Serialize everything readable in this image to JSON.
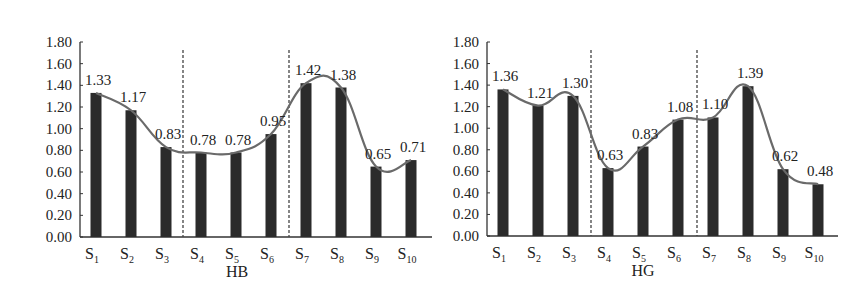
{
  "chart_data": [
    {
      "type": "bar",
      "title": "HB",
      "xlabel": "HB",
      "ylabel": "",
      "ylim": [
        0,
        1.8
      ],
      "yticks": [
        "0.00",
        "0.20",
        "0.40",
        "0.60",
        "0.80",
        "1.00",
        "1.20",
        "1.40",
        "1.60",
        "1.80"
      ],
      "grid": false,
      "legend": null,
      "categories": [
        "S1",
        "S2",
        "S3",
        "S4",
        "S5",
        "S6",
        "S7",
        "S8",
        "S9",
        "S10"
      ],
      "values": [
        1.33,
        1.17,
        0.83,
        0.78,
        0.78,
        0.95,
        1.42,
        1.38,
        0.65,
        0.71
      ],
      "value_labels": [
        "1.33",
        "1.17",
        "0.83",
        "0.78",
        "0.78",
        "0.95",
        "1.42",
        "1.38",
        "0.65",
        "0.71"
      ],
      "overlay": "smoothed trend line through bar tops",
      "dashed_separators_after": [
        "S3",
        "S6"
      ]
    },
    {
      "type": "bar",
      "title": "HG",
      "xlabel": "HG",
      "ylabel": "",
      "ylim": [
        0,
        1.8
      ],
      "yticks": [
        "0.00",
        "0.20",
        "0.40",
        "0.60",
        "0.80",
        "1.00",
        "1.20",
        "1.40",
        "1.60",
        "1.80"
      ],
      "grid": false,
      "legend": null,
      "categories": [
        "S1",
        "S2",
        "S3",
        "S4",
        "S5",
        "S6",
        "S7",
        "S8",
        "S9",
        "S10"
      ],
      "values": [
        1.36,
        1.21,
        1.3,
        0.63,
        0.83,
        1.08,
        1.1,
        1.39,
        0.62,
        0.48
      ],
      "value_labels": [
        "1.36",
        "1.21",
        "1.30",
        "0.63",
        "0.83",
        "1.08",
        "1.10",
        "1.39",
        "0.62",
        "0.48"
      ],
      "overlay": "smoothed trend line through bar tops",
      "dashed_separators_after": [
        "S3",
        "S6"
      ]
    }
  ],
  "colors": {
    "bar": "#2b2b2b",
    "line": "#6a6a6a",
    "axis": "#333333",
    "separator": "#444444"
  }
}
